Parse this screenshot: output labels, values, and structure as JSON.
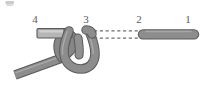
{
  "figure": {
    "kind": "knot-tying-diagram",
    "width": 207,
    "height": 85,
    "background": "#ffffff",
    "corner_artifact": {
      "name": "partial-glyph-artifact",
      "x": 5,
      "y": 1,
      "width": 9,
      "height": 5,
      "color": "#9a9a9a",
      "opacity": 0.55
    }
  },
  "labels": [
    {
      "id": "label-4",
      "text": "4",
      "x": 33,
      "y": 14
    },
    {
      "id": "label-3",
      "text": "3",
      "x": 84,
      "y": 14
    },
    {
      "id": "label-2",
      "text": "2",
      "x": 137,
      "y": 14
    },
    {
      "id": "label-1",
      "text": "1",
      "x": 186,
      "y": 14
    }
  ],
  "colors": {
    "rope_fill": "#8d8d8d",
    "rope_fill_dark": "#7d7d7d",
    "rope_stroke": "#58595b",
    "bar_fill": "#b6b6b6",
    "bar_stroke": "#58595b",
    "highlight": "#c9c9c9",
    "dash": "#6d6e71",
    "label_color": "#58595b",
    "background": "#ffffff"
  },
  "geometry": {
    "rope_width": 7.5,
    "bar": {
      "name": "upper-standing-bar",
      "x1": 38,
      "y1": 33,
      "x2": 71,
      "y2": 33,
      "thickness": 8
    },
    "right_segment": {
      "name": "right-rope-segment",
      "x1": 142,
      "y1": 34,
      "x2": 195,
      "y2": 34,
      "thickness": 8
    },
    "dashed_lines": [
      {
        "name": "dashed-guide-upper",
        "x1": 94,
        "y1": 31,
        "x2": 141,
        "y2": 31
      },
      {
        "name": "dashed-guide-lower",
        "x1": 94,
        "y1": 38,
        "x2": 141,
        "y2": 38
      }
    ],
    "tail": {
      "name": "lower-left-rope-tail",
      "x1": 16,
      "y1": 73,
      "x2": 60,
      "y2": 58
    },
    "loop": {
      "name": "u-shaped-bight",
      "description": "rope descends from point 3, curves through a U at the bottom and rises back up crossing under the upper bar"
    }
  }
}
